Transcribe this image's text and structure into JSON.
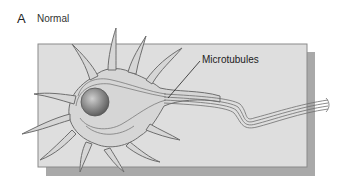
{
  "figure": {
    "panel_letter": "A",
    "panel_title": "Normal",
    "labels": {
      "microtubules": "Microtubules"
    },
    "colors": {
      "background": "#ffffff",
      "plate_fill": "#dedede",
      "plate_border": "#8a8a8a",
      "plate_shadow": "#a9a9a9",
      "cell_fill": "#d6d6d6",
      "cell_outline": "#6e6e6e",
      "nucleus": "#8f8f8f",
      "leader_line": "#222222"
    },
    "components": [
      "neuron cell body",
      "nucleus",
      "dendrites",
      "axon",
      "microtubules",
      "substrate plate"
    ]
  }
}
